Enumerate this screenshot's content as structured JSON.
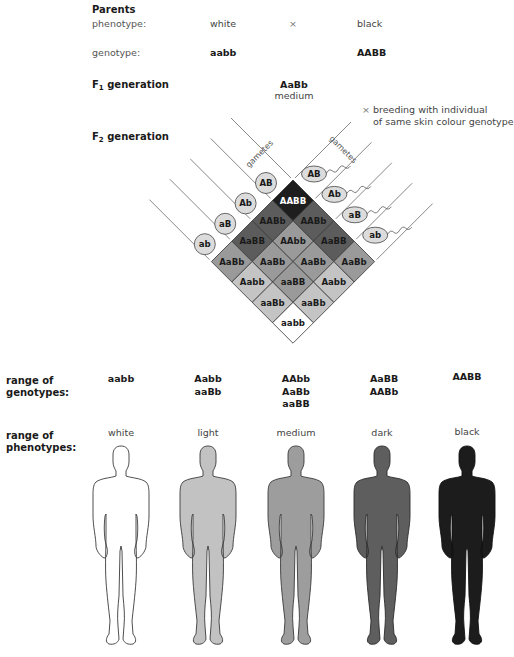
{
  "parents": {
    "heading": "Parents",
    "phenotype_label": "phenotype:",
    "phenotype_left": "white",
    "cross_symbol": "×",
    "phenotype_right": "black",
    "genotype_label": "genotype:",
    "genotype_left": "aabb",
    "genotype_right": "AABB"
  },
  "f1": {
    "heading_prefix": "F",
    "heading_sub": "1",
    "heading_suffix": " generation",
    "genotype": "AaBb",
    "phenotype": "medium",
    "note_symbol": "×",
    "note_line1": "breeding with individual",
    "note_line2": "of same skin colour genotype"
  },
  "f2": {
    "heading_prefix": "F",
    "heading_sub": "2",
    "heading_suffix": " generation",
    "gametes_label_left": "gametes",
    "gametes_label_right": "gametes",
    "left_gametes": [
      "AB",
      "Ab",
      "aB",
      "ab"
    ],
    "right_gametes": [
      "AB",
      "Ab",
      "aB",
      "ab"
    ],
    "grid": [
      [
        "AABB",
        "AABb",
        "AaBB",
        "AaBb"
      ],
      [
        "AABb",
        "AAbb",
        "AaBb",
        "Aabb"
      ],
      [
        "AaBB",
        "AaBb",
        "aaBB",
        "aaBb"
      ],
      [
        "AaBb",
        "Aabb",
        "aaBb",
        "aabb"
      ]
    ],
    "shade_by_dominant_count": {
      "4": "#1e1e1e",
      "3": "#5c5c5c",
      "2": "#9a9a9a",
      "1": "#c4c4c4",
      "0": "#ffffff"
    }
  },
  "ranges": {
    "genotypes_label_line1": "range of",
    "genotypes_label_line2": "genotypes:",
    "phenotypes_label_line1": "range of",
    "phenotypes_label_line2": "phenotypes:",
    "classes": [
      {
        "genotypes": [
          "aabb"
        ],
        "phenotype": "white",
        "fill": "#ffffff"
      },
      {
        "genotypes": [
          "Aabb",
          "aaBb"
        ],
        "phenotype": "light",
        "fill": "#c2c2c2"
      },
      {
        "genotypes": [
          "AAbb",
          "AaBb",
          "aaBB"
        ],
        "phenotype": "medium",
        "fill": "#9d9d9d"
      },
      {
        "genotypes": [
          "AaBB",
          "AABb"
        ],
        "phenotype": "dark",
        "fill": "#5e5e5e"
      },
      {
        "genotypes": [
          "AABB"
        ],
        "phenotype": "black",
        "fill": "#1c1c1c"
      }
    ]
  }
}
